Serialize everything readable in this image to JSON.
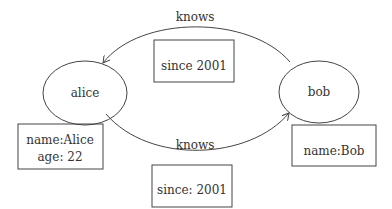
{
  "nodes": [
    {
      "id": "alice",
      "label": "alice"
    },
    {
      "id": "bob",
      "label": "bob"
    }
  ],
  "edges": [
    {
      "from": "bob",
      "to": "alice",
      "label": "knows",
      "property": "since 2001"
    },
    {
      "from": "alice",
      "to": "bob",
      "label": "knows",
      "property": "since: 2001"
    }
  ],
  "properties": {
    "alice": [
      "name:Alice",
      "age: 22"
    ],
    "bob": [
      "name:Bob"
    ]
  },
  "colors": {
    "stroke": "#444444",
    "text": "#333333"
  }
}
